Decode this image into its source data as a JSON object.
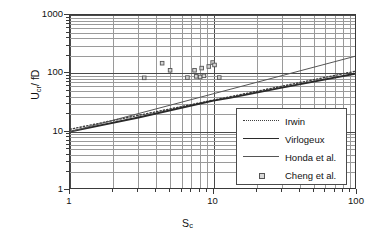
{
  "chart_data": {
    "type": "line",
    "title": "",
    "xlabel": "Sc",
    "xlabel_base": "S",
    "xlabel_sub": "c",
    "ylabel": "Ucr/ fD",
    "ylabel_base": "U",
    "ylabel_sub": "cr",
    "ylabel_tail": "/ fD",
    "xscale": "log",
    "yscale": "log",
    "xlim": [
      1,
      100
    ],
    "ylim": [
      1,
      1000
    ],
    "grid": true,
    "grid_minor": true,
    "legend_position": "lower right",
    "xticks": [
      "1",
      "10",
      "100"
    ],
    "xtick_values": [
      1,
      10,
      100
    ],
    "yticks": [
      "1",
      "10",
      "100",
      "1000"
    ],
    "ytick_values": [
      1,
      10,
      100,
      1000
    ],
    "series": [
      {
        "name": "Irwin",
        "style": "dotted",
        "color": "#3f3f3f",
        "x": [
          1,
          100
        ],
        "y": [
          11,
          110
        ]
      },
      {
        "name": "Virlogeux",
        "style": "solid-thick",
        "color": "#2a2a2a",
        "x": [
          1,
          3,
          10,
          13,
          30,
          100
        ],
        "y": [
          10,
          17.5,
          34,
          38,
          57,
          100
        ]
      },
      {
        "name": "Honda et al.",
        "style": "solid-thin",
        "color": "#555555",
        "x": [
          1,
          100
        ],
        "y": [
          10,
          200
        ]
      },
      {
        "name": "Cheng et al.",
        "style": "marker",
        "marker": "square",
        "color": "#555555",
        "points": [
          {
            "x": 3.3,
            "y": 83
          },
          {
            "x": 4.4,
            "y": 148
          },
          {
            "x": 5.0,
            "y": 112
          },
          {
            "x": 6.6,
            "y": 84
          },
          {
            "x": 7.4,
            "y": 112
          },
          {
            "x": 7.6,
            "y": 88
          },
          {
            "x": 8.1,
            "y": 86
          },
          {
            "x": 8.3,
            "y": 122
          },
          {
            "x": 8.6,
            "y": 90
          },
          {
            "x": 9.3,
            "y": 130
          },
          {
            "x": 9.9,
            "y": 152
          },
          {
            "x": 10.2,
            "y": 138
          },
          {
            "x": 11.0,
            "y": 84
          }
        ]
      }
    ]
  },
  "legend": {
    "items": [
      {
        "label": "Irwin",
        "key": "dotted"
      },
      {
        "label": "Virlogeux",
        "key": "solid-thick"
      },
      {
        "label": "Honda et al.",
        "key": "solid-thin"
      },
      {
        "label": "Cheng et al.",
        "key": "marker"
      }
    ]
  },
  "colors": {
    "axis": "#3a3a3a",
    "grid_major": "#4a4a4a",
    "grid_minor": "#9a9a9a",
    "background": "#ffffff",
    "text": "#111111"
  }
}
